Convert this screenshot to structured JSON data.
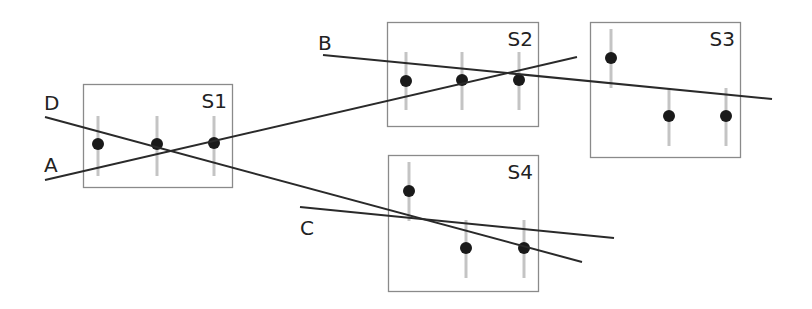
{
  "diagram": {
    "panels": [
      {
        "id": "S1",
        "label": "S1",
        "box": [
          83,
          84,
          149,
          103
        ],
        "points": [
          {
            "x": 98,
            "y": 144,
            "err": [
              116,
              176
            ]
          },
          {
            "x": 157,
            "y": 144,
            "err": [
              116,
              176
            ]
          },
          {
            "x": 214,
            "y": 143,
            "err": [
              116,
              176
            ]
          }
        ]
      },
      {
        "id": "S2",
        "label": "S2",
        "box": [
          387,
          22,
          151,
          104
        ],
        "points": [
          {
            "x": 406,
            "y": 81,
            "err": [
              52,
              110
            ]
          },
          {
            "x": 462,
            "y": 80,
            "err": [
              52,
              110
            ]
          },
          {
            "x": 519,
            "y": 80,
            "err": [
              52,
              110
            ]
          }
        ]
      },
      {
        "id": "S3",
        "label": "S3",
        "box": [
          590,
          22,
          150,
          135
        ],
        "points": [
          {
            "x": 611,
            "y": 58,
            "err": [
              29,
              88
            ]
          },
          {
            "x": 669,
            "y": 116,
            "err": [
              88,
              146
            ]
          },
          {
            "x": 726,
            "y": 116,
            "err": [
              88,
              146
            ]
          }
        ]
      },
      {
        "id": "S4",
        "label": "S4",
        "box": [
          388,
          155,
          150,
          136
        ],
        "points": [
          {
            "x": 409,
            "y": 191,
            "err": [
              162,
              221
            ]
          },
          {
            "x": 466,
            "y": 248,
            "err": [
              220,
              278
            ]
          },
          {
            "x": 524,
            "y": 248,
            "err": [
              220,
              278
            ]
          }
        ]
      }
    ],
    "lines": [
      {
        "id": "A",
        "label": "A",
        "x1": 45,
        "y1": 180,
        "x2": 577,
        "y2": 57,
        "lx": 44,
        "ly": 172
      },
      {
        "id": "B",
        "label": "B",
        "x1": 323,
        "y1": 55,
        "x2": 772,
        "y2": 99,
        "lx": 318,
        "ly": 50
      },
      {
        "id": "C",
        "label": "C",
        "x1": 300,
        "y1": 207,
        "x2": 614,
        "y2": 238,
        "lx": 300,
        "ly": 235
      },
      {
        "id": "D",
        "label": "D",
        "x1": 45,
        "y1": 117,
        "x2": 582,
        "y2": 262,
        "lx": 44,
        "ly": 110
      }
    ],
    "colors": {
      "box": "#8a8a8a",
      "line": "#2a2a2a",
      "point": "#1a1a1a",
      "errorbar": "#c4c4c4"
    }
  }
}
